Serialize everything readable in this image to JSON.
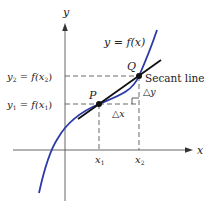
{
  "figure": {
    "axes": {
      "x_label": "x",
      "y_label": "y"
    },
    "curve_label": "y = f(x)",
    "points": {
      "P": "P",
      "Q": "Q"
    },
    "secant_label": "Secant line",
    "delta_x": "△x",
    "delta_y": "△y",
    "ticks": {
      "x1": "x",
      "x1_sub": "1",
      "x2": "x",
      "x2_sub": "2"
    },
    "y_levels": {
      "y1_text": "y",
      "y1_sub": "1",
      "y1_eq": " = f(x",
      "y1_arg_sub": "1",
      "y1_close": ")",
      "y2_text": "y",
      "y2_sub": "2",
      "y2_eq": " = f(x",
      "y2_arg_sub": "2",
      "y2_close": ")"
    },
    "colors": {
      "curve": "#2b3aa8",
      "secant": "#111111",
      "axes": "#333333",
      "dashes": "#444444"
    }
  }
}
